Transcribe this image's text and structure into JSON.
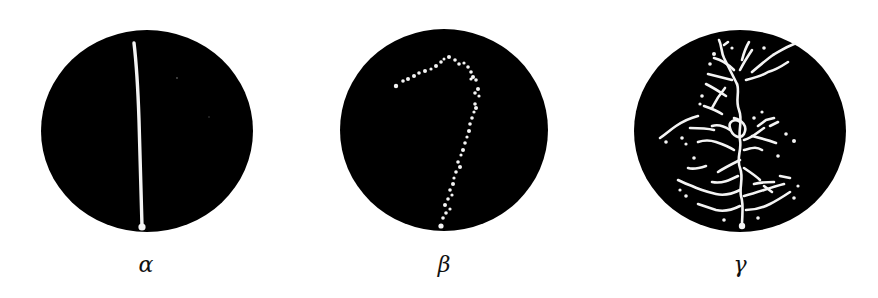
{
  "figure": {
    "background_color": "#ffffff",
    "disc_color": "#000000",
    "track_color": "#f4f4f4",
    "panels": [
      {
        "id": "alpha",
        "label": "α",
        "description": "single straight continuous track"
      },
      {
        "id": "beta",
        "label": "β",
        "description": "dotted curved track, hook shape"
      },
      {
        "id": "gamma",
        "label": "γ",
        "description": "branching tree of dotted tracks"
      }
    ]
  }
}
